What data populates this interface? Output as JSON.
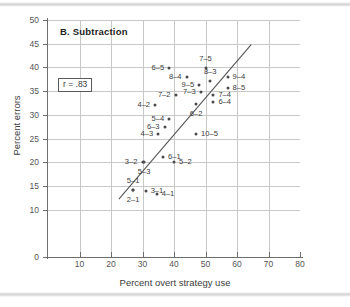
{
  "chart_data": {
    "type": "scatter",
    "title": "B. Subtraction",
    "xlabel": "Percent overt strategy use",
    "ylabel": "Percent errors",
    "xlim": [
      0,
      80
    ],
    "ylim": [
      0,
      50
    ],
    "xticks": [
      10,
      20,
      30,
      40,
      50,
      60,
      70,
      80
    ],
    "yticks": [
      0,
      10,
      15,
      20,
      25,
      30,
      35,
      40,
      45,
      50
    ],
    "grid": true,
    "legend": "none",
    "annotation": "r = .83",
    "correlation": 0.83,
    "trendline": {
      "x0": 22.5,
      "y0": 12.2,
      "x1": 64.5,
      "y1": 44.8
    },
    "points": [
      {
        "label": "6-5",
        "x": 38.5,
        "y": 39.8,
        "label_pos": "left"
      },
      {
        "label": "7-5",
        "x": 50.0,
        "y": 39.8,
        "label_pos": "above"
      },
      {
        "label": "8-4",
        "x": 44.0,
        "y": 38.0,
        "label_pos": "left"
      },
      {
        "label": "8-3",
        "x": 51.5,
        "y": 37.2,
        "label_pos": "above"
      },
      {
        "label": "9-4",
        "x": 57.0,
        "y": 38.0,
        "label_pos": "right"
      },
      {
        "label": "9-5",
        "x": 48.0,
        "y": 36.3,
        "label_pos": "left"
      },
      {
        "label": "8-5",
        "x": 57.0,
        "y": 35.7,
        "label_pos": "right"
      },
      {
        "label": "7-3",
        "x": 48.5,
        "y": 34.8,
        "label_pos": "left"
      },
      {
        "label": "7-2",
        "x": 40.5,
        "y": 34.2,
        "label_pos": "left"
      },
      {
        "label": "7-4",
        "x": 52.5,
        "y": 34.2,
        "label_pos": "right"
      },
      {
        "label": "4-2",
        "x": 34.0,
        "y": 32.0,
        "label_pos": "left"
      },
      {
        "label": "6-2",
        "x": 47.0,
        "y": 32.2,
        "label_pos": "below"
      },
      {
        "label": "6-4",
        "x": 52.5,
        "y": 32.6,
        "label_pos": "right"
      },
      {
        "label": "5-4",
        "x": 38.5,
        "y": 29.2,
        "label_pos": "left"
      },
      {
        "label": "6-3",
        "x": 37.0,
        "y": 27.5,
        "label_pos": "left"
      },
      {
        "label": "4-3",
        "x": 35.0,
        "y": 26.0,
        "label_pos": "left"
      },
      {
        "label": "10-5",
        "x": 47.0,
        "y": 26.0,
        "label_pos": "right"
      },
      {
        "label": "6-1",
        "x": 36.5,
        "y": 21.2,
        "label_pos": "right"
      },
      {
        "label": "3-2",
        "x": 30.0,
        "y": 20.0,
        "label_pos": "left"
      },
      {
        "label": "5-3",
        "x": 30.5,
        "y": 20.0,
        "label_pos": "below"
      },
      {
        "label": "5-2",
        "x": 40.0,
        "y": 20.0,
        "label_pos": "right"
      },
      {
        "label": "5-1",
        "x": 27.0,
        "y": 14.2,
        "label_pos": "above"
      },
      {
        "label": "3-1",
        "x": 31.0,
        "y": 14.0,
        "label_pos": "right"
      },
      {
        "label": "2-1",
        "x": 27.0,
        "y": 14.2,
        "label_pos": "below"
      },
      {
        "label": "4-1",
        "x": 34.5,
        "y": 13.2,
        "label_pos": "right"
      }
    ]
  }
}
